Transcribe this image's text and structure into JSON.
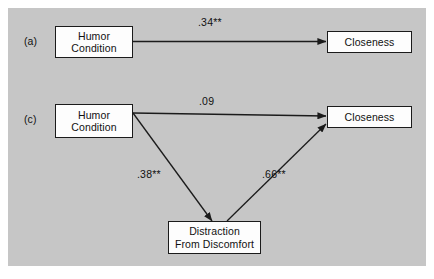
{
  "figure": {
    "background_color": "#c6c6c6",
    "page_color": "#ffffff",
    "box_fill": "#fdfdfd",
    "line_color": "#1b1b1b"
  },
  "panels": [
    {
      "tag": "(a)",
      "nodes": {
        "predictor": "Humor\nCondition",
        "outcome": "Closeness"
      },
      "paths": [
        {
          "label": ".34**",
          "from": "predictor",
          "to": "outcome"
        }
      ]
    },
    {
      "tag": "(c)",
      "nodes": {
        "predictor": "Humor\nCondition",
        "mediator": "Distraction\nFrom Discomfort",
        "outcome": "Closeness"
      },
      "paths": [
        {
          "label": ".09",
          "from": "predictor",
          "to": "outcome"
        },
        {
          "label": ".38**",
          "from": "predictor",
          "to": "mediator"
        },
        {
          "label": ".66**",
          "from": "mediator",
          "to": "outcome"
        }
      ]
    }
  ],
  "labels": {
    "panel_a_tag": "(a)",
    "panel_c_tag": "(c)",
    "a_humor": "Humor\nCondition",
    "a_closeness": "Closeness",
    "a_path": ".34**",
    "c_humor": "Humor\nCondition",
    "c_closeness": "Closeness",
    "c_distraction": "Distraction\nFrom Discomfort",
    "c_direct_path": ".09",
    "c_a_path": ".38**",
    "c_b_path": ".66**"
  }
}
